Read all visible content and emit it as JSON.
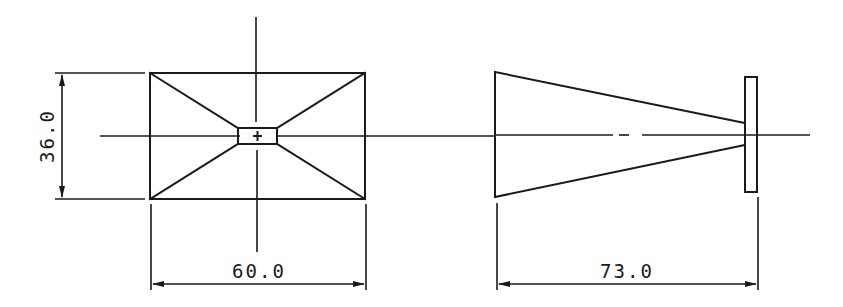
{
  "drawing": {
    "views": [
      {
        "name": "front-view",
        "shape": "rectangle with pyramidal horn taper to small aperture",
        "dimensions": {
          "height_label": "36.0",
          "width_label": "60.0"
        }
      },
      {
        "name": "side-view",
        "shape": "tapered horn with flange",
        "dimensions": {
          "length_label": "73.0"
        }
      }
    ],
    "colors": {
      "line": "#1a1a1a",
      "background": "#ffffff"
    }
  }
}
